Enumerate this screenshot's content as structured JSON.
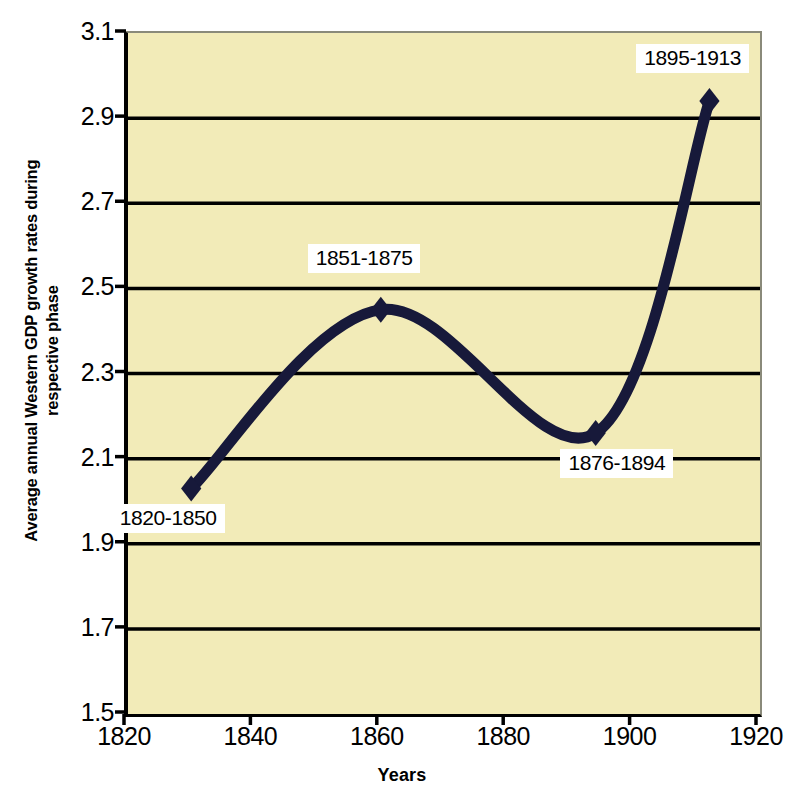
{
  "chart_data": {
    "type": "line",
    "title": "",
    "subtitle": "",
    "xlabel": "Years",
    "ylabel": "Average annual Western GDP growth rates during respective phase",
    "ylabel_lines": [
      "Average annual Western GDP growth rates during",
      "respective phase"
    ],
    "xlim": [
      1820,
      1920
    ],
    "ylim": [
      1.5,
      3.1
    ],
    "xticks": [
      1820,
      1840,
      1860,
      1880,
      1900,
      1920
    ],
    "xtick_labels": [
      "1820",
      "1840",
      "1860",
      "1880",
      "1900",
      "1920"
    ],
    "yticks": [
      1.5,
      1.7,
      1.9,
      2.1,
      2.3,
      2.5,
      2.7,
      2.9,
      3.1
    ],
    "ytick_labels": [
      "1.5",
      "1.7",
      "1.9",
      "2.1",
      "2.3",
      "2.5",
      "2.7",
      "2.9",
      "3.1"
    ],
    "grid": true,
    "grid_axis": "y",
    "legend": false,
    "legend_position": "none",
    "marker": "diamond",
    "smooth": true,
    "series": [
      {
        "name": "Average annual Western GDP growth rate",
        "x": [
          1830,
          1860,
          1894,
          1912
        ],
        "values": [
          2.03,
          2.45,
          2.16,
          2.94
        ],
        "point_labels": [
          "1820-1850",
          "1851-1875",
          "1876-1894",
          "1895-1913"
        ]
      }
    ],
    "annotations": [
      {
        "text": "1820-1850",
        "for_point_index": 0,
        "x": 1827,
        "y": 1.955
      },
      {
        "text": "1851-1875",
        "for_point_index": 1,
        "x": 1858,
        "y": 2.565
      },
      {
        "text": "1876-1894",
        "for_point_index": 2,
        "x": 1898,
        "y": 2.085
      },
      {
        "text": "1895-1913",
        "for_point_index": 3,
        "x": 1910,
        "y": 3.035
      }
    ],
    "colors": {
      "plot_background": "#F2EBB8",
      "figure_background": "#FFFFFF",
      "line": "#17193A",
      "marker": "#17193A",
      "grid": "#000000",
      "axis": "#000000",
      "label_background": "#FFFFFF",
      "label_text": "#000000"
    }
  }
}
